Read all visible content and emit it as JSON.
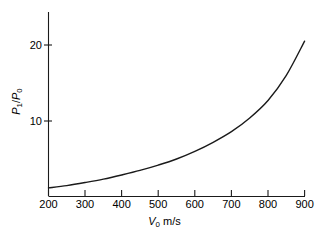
{
  "chart_data": {
    "type": "line",
    "title": "",
    "subtitle": "",
    "xlabel": "V_0 m/s",
    "xlabel_parts": {
      "symbol": "V",
      "subscript": "0",
      "units": "m/s"
    },
    "ylabel": "P_1/P_0",
    "ylabel_parts": {
      "numerator": "P",
      "numerator_sub": "1",
      "separator": "/",
      "denominator": "P",
      "denominator_sub": "0"
    },
    "xlim": [
      200,
      900
    ],
    "ylim": [
      0,
      22.8
    ],
    "xticks": [
      200,
      300,
      400,
      500,
      600,
      700,
      800,
      900
    ],
    "xtick_labels": [
      "200",
      "300",
      "400",
      "500",
      "600",
      "700",
      "800",
      "900"
    ],
    "yticks": [
      10,
      20
    ],
    "ytick_labels": [
      "10",
      "20"
    ],
    "grid": false,
    "legend": null,
    "legend_position": "none",
    "axis_style": "left-and-bottom-spines",
    "line_color": "#1a1a1a",
    "line_width": 1.4,
    "background_color": "#ffffff",
    "series": [
      {
        "name": "P1/P0 vs V0",
        "x": [
          200,
          250,
          300,
          350,
          400,
          450,
          500,
          550,
          600,
          650,
          700,
          750,
          800,
          850,
          900
        ],
        "values": [
          1.2,
          1.5,
          1.9,
          2.35,
          2.9,
          3.5,
          4.2,
          5.0,
          6.0,
          7.2,
          8.6,
          10.4,
          12.7,
          16.0,
          20.5
        ]
      }
    ]
  }
}
